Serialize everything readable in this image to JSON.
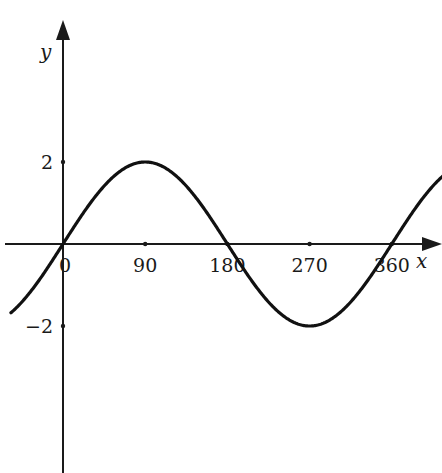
{
  "chart_data": {
    "type": "line",
    "title": "",
    "function": "y = 2 sin(x)",
    "xlabel": "x",
    "ylabel": "y",
    "x_ticks": [
      0,
      90,
      180,
      270,
      360
    ],
    "x_tick_labels": [
      "0",
      "90",
      "180",
      "270",
      "360"
    ],
    "y_ticks": [
      2,
      -2
    ],
    "y_tick_labels": [
      "2",
      "−2"
    ],
    "xlim": [
      -57,
      416
    ],
    "ylim": [
      -5.3,
      5.8
    ],
    "grid": false,
    "legend": null,
    "series": [
      {
        "name": "y = 2 sin x",
        "amplitude": 2,
        "period": 360,
        "x": [
          -57,
          -45,
          0,
          45,
          90,
          135,
          180,
          225,
          270,
          315,
          360,
          405,
          416
        ],
        "y": [
          -1.68,
          -1.41,
          0,
          1.41,
          2,
          1.41,
          0,
          -1.41,
          -2,
          -1.41,
          0,
          1.41,
          1.64
        ]
      }
    ]
  },
  "layout": {
    "origin_px": [
      63,
      244
    ],
    "px_per_degree": 0.9133,
    "px_per_unit_y": 41.0,
    "line_color": "#111111"
  }
}
